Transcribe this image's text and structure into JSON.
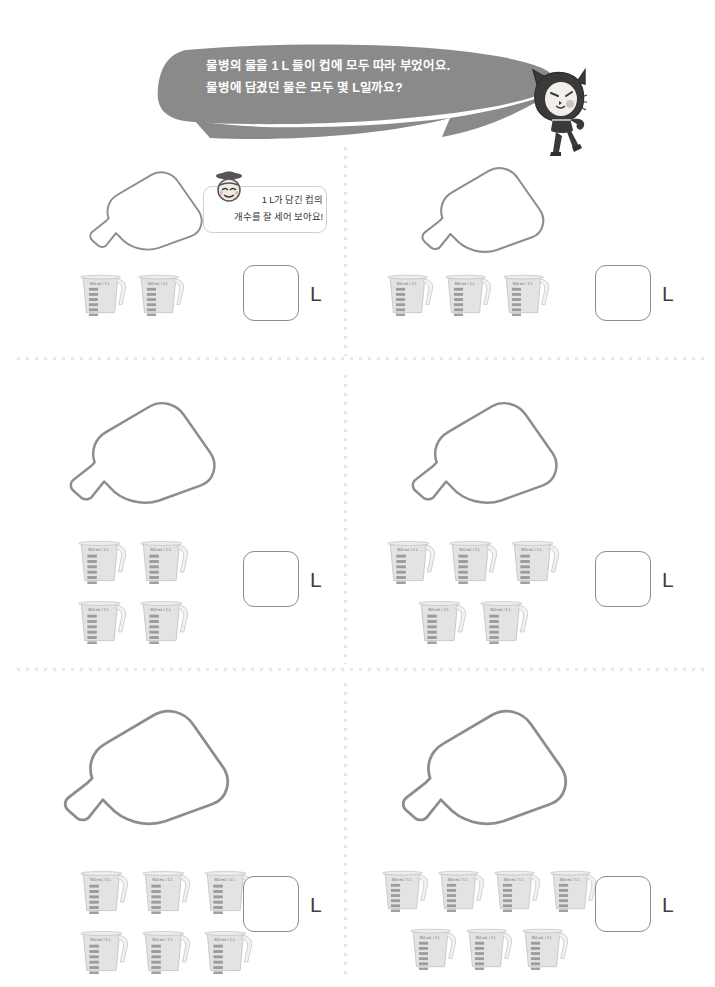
{
  "header": {
    "bubble_text": "물병의 물을 1 L 들이 컵에 모두 따라 부었어요.\n물병에 담겼던 물은 모두 몇 L일까요?",
    "mascot_name": "cat-mascot"
  },
  "hint": {
    "text": "1 L가 담긴 컵의\n개수를 잘 세어 보아요!",
    "face_name": "teacher-face"
  },
  "cup": {
    "label": "800 mL / 1 L",
    "tick_count": 10
  },
  "answer": {
    "unit": "L",
    "value": ""
  },
  "colors": {
    "bubble": "#8a8a8a",
    "bubble_text": "#ffffff",
    "outline": "#8d8d8d",
    "divider": "#e6e6e6",
    "cup_body": "#e3e3e3",
    "cup_tick": "#8f8f8f",
    "mascot_dark": "#3a3a3a"
  },
  "panels": [
    {
      "id": "panel-1",
      "position": "row1-left",
      "bottle_scale": 0.82,
      "cup_count": 2,
      "cup_rows": [
        2
      ],
      "answer_value": "",
      "has_hint": true
    },
    {
      "id": "panel-2",
      "position": "row1-right",
      "bottle_scale": 0.88,
      "cup_count": 3,
      "cup_rows": [
        3
      ],
      "answer_value": "",
      "has_hint": false
    },
    {
      "id": "panel-3",
      "position": "row2-left",
      "bottle_scale": 1.05,
      "cup_count": 4,
      "cup_rows": [
        2,
        2
      ],
      "answer_value": "",
      "has_hint": false
    },
    {
      "id": "panel-4",
      "position": "row2-right",
      "bottle_scale": 1.05,
      "cup_count": 5,
      "cup_rows": [
        3,
        2
      ],
      "answer_value": "",
      "has_hint": false
    },
    {
      "id": "panel-5",
      "position": "row3-left",
      "bottle_scale": 1.2,
      "cup_count": 6,
      "cup_rows": [
        3,
        3
      ],
      "answer_value": "",
      "has_hint": false
    },
    {
      "id": "panel-6",
      "position": "row3-right",
      "bottle_scale": 1.2,
      "cup_count": 7,
      "cup_rows": [
        4,
        3
      ],
      "answer_value": "",
      "has_hint": false
    }
  ]
}
